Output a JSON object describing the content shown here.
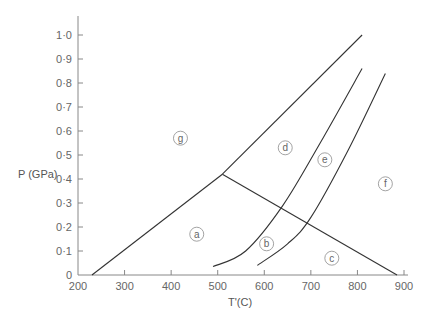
{
  "header_fragment": "····· ····· ·· ·········· ···· ·",
  "chart_data": {
    "type": "line",
    "title": "",
    "xlabel": "T'(C)",
    "ylabel": "P (GPa)",
    "xlim": [
      200,
      900
    ],
    "ylim": [
      0,
      1.0
    ],
    "grid": false,
    "x_ticks": [
      "200",
      "300",
      "400",
      "500",
      "600",
      "700",
      "800",
      "900"
    ],
    "y_ticks": [
      "0",
      "0·1",
      "0·2",
      "0·3",
      "0·4",
      "0·5",
      "0·6",
      "0·7",
      "0·8",
      "0·9",
      "1·0"
    ],
    "series": [
      {
        "name": "boundary-lower-left",
        "points": [
          [
            230,
            0.0
          ],
          [
            510,
            0.42
          ]
        ]
      },
      {
        "name": "boundary-upper",
        "points": [
          [
            510,
            0.42
          ],
          [
            810,
            1.0
          ]
        ]
      },
      {
        "name": "boundary-descending",
        "points": [
          [
            510,
            0.42
          ],
          [
            885,
            0.0
          ]
        ]
      },
      {
        "name": "curve-1",
        "points": [
          [
            490,
            0.035
          ],
          [
            560,
            0.1
          ],
          [
            640,
            0.29
          ],
          [
            720,
            0.55
          ],
          [
            810,
            0.86
          ]
        ]
      },
      {
        "name": "curve-2",
        "points": [
          [
            585,
            0.04
          ],
          [
            650,
            0.13
          ],
          [
            700,
            0.24
          ],
          [
            780,
            0.52
          ],
          [
            860,
            0.84
          ]
        ]
      }
    ],
    "region_labels": [
      {
        "label": "a",
        "x": 455,
        "y": 0.17
      },
      {
        "label": "b",
        "x": 605,
        "y": 0.13
      },
      {
        "label": "c",
        "x": 745,
        "y": 0.07
      },
      {
        "label": "d",
        "x": 645,
        "y": 0.53
      },
      {
        "label": "e",
        "x": 730,
        "y": 0.48
      },
      {
        "label": "f",
        "x": 860,
        "y": 0.38
      },
      {
        "label": "g",
        "x": 420,
        "y": 0.57
      }
    ],
    "legend": null
  }
}
